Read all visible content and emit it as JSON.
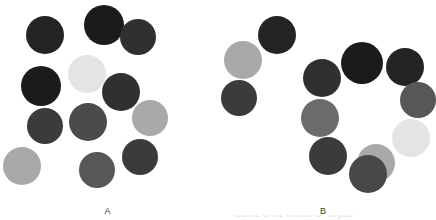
{
  "figure": {
    "background": "#ffffff",
    "width": 431,
    "height": 220,
    "clipped_caption": "relative to the number of Targets"
  },
  "palette": {
    "near_black": "#1b1b1b",
    "very_dark": "#242424",
    "dark": "#303030",
    "dark_gray": "#3b3b3b",
    "mid_dark_gray": "#484848",
    "mid_gray": "#575757",
    "gray": "#6b6b6b",
    "light_gray": "#a9a9a9",
    "very_light_gray": "#d9d9d9",
    "pale": "#e4e4e4"
  },
  "panels": [
    {
      "id": "A",
      "label": "A",
      "dot_count": 12,
      "arrangement": "random-scatter",
      "dots": [
        {
          "name": "dot-a-1",
          "cx": 45,
          "cy": 35,
          "r": 19,
          "color": "#242424"
        },
        {
          "name": "dot-a-2",
          "cx": 104,
          "cy": 25,
          "r": 20,
          "color": "#1b1b1b"
        },
        {
          "name": "dot-a-3",
          "cx": 138,
          "cy": 37,
          "r": 18,
          "color": "#303030"
        },
        {
          "name": "dot-a-4",
          "cx": 87,
          "cy": 74,
          "r": 19,
          "color": "#e4e4e4"
        },
        {
          "name": "dot-a-5",
          "cx": 41,
          "cy": 86,
          "r": 20,
          "color": "#1b1b1b"
        },
        {
          "name": "dot-a-6",
          "cx": 121,
          "cy": 92,
          "r": 19,
          "color": "#303030"
        },
        {
          "name": "dot-a-7",
          "cx": 88,
          "cy": 122,
          "r": 19,
          "color": "#4b4b4b"
        },
        {
          "name": "dot-a-8",
          "cx": 45,
          "cy": 126,
          "r": 18,
          "color": "#3b3b3b"
        },
        {
          "name": "dot-a-9",
          "cx": 150,
          "cy": 118,
          "r": 18,
          "color": "#a9a9a9"
        },
        {
          "name": "dot-a-10",
          "cx": 22,
          "cy": 166,
          "r": 19,
          "color": "#a9a9a9"
        },
        {
          "name": "dot-a-11",
          "cx": 97,
          "cy": 170,
          "r": 18,
          "color": "#575757"
        },
        {
          "name": "dot-a-12",
          "cx": 140,
          "cy": 157,
          "r": 18,
          "color": "#3b3b3b"
        }
      ]
    },
    {
      "id": "B",
      "label": "B",
      "dot_count": 12,
      "arrangement": "ring-plus-scatter",
      "dots": [
        {
          "name": "dot-b-1",
          "cx": 62,
          "cy": 35,
          "r": 19,
          "color": "#242424"
        },
        {
          "name": "dot-b-2",
          "cx": 28,
          "cy": 60,
          "r": 19,
          "color": "#a9a9a9"
        },
        {
          "name": "dot-b-3",
          "cx": 24,
          "cy": 98,
          "r": 18,
          "color": "#3b3b3b"
        },
        {
          "name": "dot-b-4",
          "cx": 107,
          "cy": 78,
          "r": 19,
          "color": "#303030"
        },
        {
          "name": "dot-b-5",
          "cx": 147,
          "cy": 63,
          "r": 21,
          "color": "#1b1b1b"
        },
        {
          "name": "dot-b-6",
          "cx": 190,
          "cy": 67,
          "r": 19,
          "color": "#242424"
        },
        {
          "name": "dot-b-7",
          "cx": 203,
          "cy": 100,
          "r": 18,
          "color": "#575757"
        },
        {
          "name": "dot-b-8",
          "cx": 196,
          "cy": 138,
          "r": 19,
          "color": "#e4e4e4"
        },
        {
          "name": "dot-b-9",
          "cx": 161,
          "cy": 163,
          "r": 19,
          "color": "#a9a9a9"
        },
        {
          "name": "dot-b-10",
          "cx": 105,
          "cy": 118,
          "r": 19,
          "color": "#6b6b6b"
        },
        {
          "name": "dot-b-11",
          "cx": 113,
          "cy": 156,
          "r": 19,
          "color": "#3b3b3b"
        },
        {
          "name": "dot-b-12",
          "cx": 153,
          "cy": 174,
          "r": 19,
          "color": "#484848"
        }
      ]
    }
  ]
}
